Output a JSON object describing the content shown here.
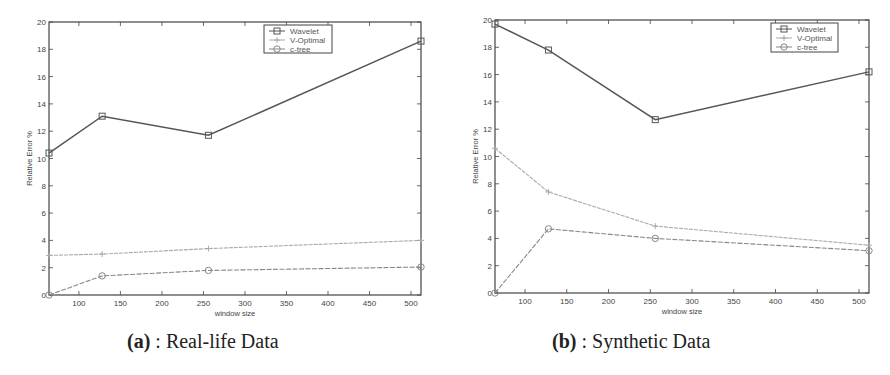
{
  "chart_data": [
    {
      "type": "line",
      "panel": "a",
      "caption_label": "(a)",
      "caption_text": " : Real-life Data",
      "title": "",
      "xlabel": "window size",
      "ylabel": "Relative Error %",
      "x": [
        64,
        128,
        256,
        512
      ],
      "xlim": [
        64,
        512
      ],
      "ylim": [
        0,
        20
      ],
      "xticks": [
        100,
        150,
        200,
        250,
        300,
        350,
        400,
        450,
        500
      ],
      "yticks": [
        0,
        2,
        4,
        6,
        8,
        10,
        12,
        14,
        16,
        18,
        20
      ],
      "grid": false,
      "legend_position": "upper right",
      "series": [
        {
          "name": "Wavelet",
          "marker": "square",
          "color": "#555555",
          "values": [
            10.4,
            13.1,
            11.7,
            18.6
          ]
        },
        {
          "name": "V-Optimal",
          "marker": "plus",
          "color": "#aaaaaa",
          "values": [
            2.9,
            3.0,
            3.4,
            4.0
          ]
        },
        {
          "name": "c-tree",
          "marker": "circle",
          "color": "#888888",
          "values": [
            0.0,
            1.4,
            1.8,
            2.05
          ]
        }
      ]
    },
    {
      "type": "line",
      "panel": "b",
      "caption_label": "(b)",
      "caption_text": " : Synthetic Data",
      "title": "",
      "xlabel": "window size",
      "ylabel": "Relative Error %",
      "x": [
        64,
        128,
        256,
        512
      ],
      "xlim": [
        64,
        512
      ],
      "ylim": [
        0,
        20
      ],
      "xticks": [
        100,
        150,
        200,
        250,
        300,
        350,
        400,
        450,
        500
      ],
      "yticks": [
        0,
        2,
        4,
        6,
        8,
        10,
        12,
        14,
        16,
        18,
        20
      ],
      "grid": false,
      "legend_position": "upper right",
      "series": [
        {
          "name": "Wavelet",
          "marker": "square",
          "color": "#555555",
          "values": [
            19.7,
            17.8,
            12.7,
            16.2
          ]
        },
        {
          "name": "V-Optimal",
          "marker": "plus",
          "color": "#aaaaaa",
          "values": [
            10.6,
            7.4,
            4.9,
            3.5
          ]
        },
        {
          "name": "c-tree",
          "marker": "circle",
          "color": "#888888",
          "values": [
            0.0,
            4.7,
            4.0,
            3.1
          ]
        }
      ]
    }
  ]
}
